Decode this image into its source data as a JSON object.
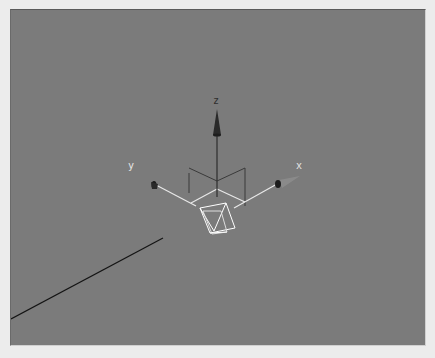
{
  "viewport": {
    "type": "perspective-3d",
    "background_color": "#7b7b7b",
    "frame_color": "#ececec"
  },
  "gizmo": {
    "axes": [
      {
        "name": "x",
        "label": "x",
        "color": "#dcdcdc"
      },
      {
        "name": "y",
        "label": "y",
        "color": "#dcdcdc"
      },
      {
        "name": "z",
        "label": "z",
        "color": "#2e2e2e"
      }
    ],
    "arrow_color": "#2a2a2a",
    "ground_line_color": "#e8e8e8"
  },
  "camera_object": {
    "icon": "camera-wireframe-icon",
    "color": "#ffffff"
  },
  "line_object": {
    "color": "#141414"
  }
}
